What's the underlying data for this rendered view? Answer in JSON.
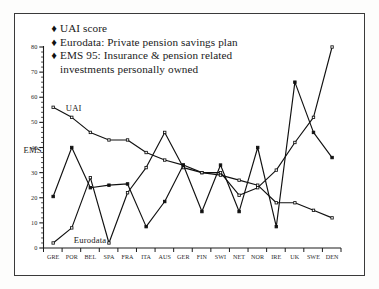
{
  "chart_data": {
    "type": "line",
    "title": "",
    "xlabel": "",
    "ylabel": "",
    "ylim": [
      0,
      80
    ],
    "yticks": [
      0,
      10,
      20,
      30,
      40,
      50,
      60,
      70,
      80
    ],
    "grid": false,
    "legend_position": "top-left",
    "categories": [
      "GRE",
      "POR",
      "BEL",
      "SPA",
      "FRA",
      "ITA",
      "AUS",
      "GER",
      "FIN",
      "SWI",
      "NET",
      "NOR",
      "IRE",
      "UK",
      "SWE",
      "DEN"
    ],
    "series": [
      {
        "name": "UAI score",
        "marker": "open-square",
        "values": [
          56,
          52,
          46,
          43,
          43,
          38,
          35,
          33,
          30,
          29,
          27,
          25,
          18,
          18,
          15,
          12
        ]
      },
      {
        "name": "Eurodata: Private pension savings plan",
        "marker": "open-square",
        "values": [
          2,
          8,
          28,
          2,
          22,
          32,
          46,
          32,
          30,
          30,
          21,
          24,
          31,
          42,
          52,
          80
        ]
      },
      {
        "name": "EMS 95: Insurance & pension related investments personally owned",
        "marker": "filled-square",
        "values": [
          20.5,
          40,
          24,
          25,
          25.5,
          8.5,
          18.5,
          33,
          14.5,
          33,
          14.5,
          40,
          8.5,
          66,
          46,
          36
        ]
      }
    ],
    "annotations": [
      {
        "text": "UAI",
        "near": "GRE-POR"
      },
      {
        "text": "EMS",
        "near": "left-axis"
      },
      {
        "text": "Eurodata",
        "near": "bottom-left"
      }
    ]
  },
  "legend": {
    "marker_glyph": "♦",
    "items": [
      {
        "label": "UAI score"
      },
      {
        "label": "Eurodata: Private pension savings plan"
      },
      {
        "label": "EMS 95: Insurance & pension related"
      }
    ],
    "continuation": "investments personally owned"
  },
  "annotations": {
    "uai": "UAI",
    "ems": "EMS",
    "eurodata": "Eurodata"
  }
}
